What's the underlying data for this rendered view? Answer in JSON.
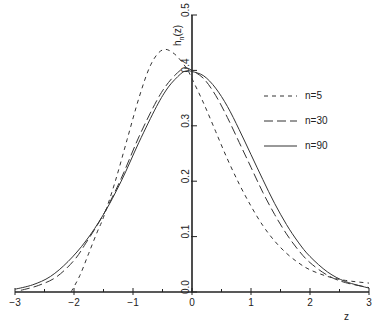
{
  "chart_data": {
    "type": "line",
    "title": "",
    "xlabel": "z",
    "ylabel": "h_n(z)",
    "xlim": [
      -3,
      3
    ],
    "ylim": [
      0.0,
      0.5
    ],
    "grid": false,
    "legend_position": "right, inside",
    "x_ticks": [
      "-3",
      "-2",
      "-1",
      "0",
      "1",
      "2",
      "3"
    ],
    "y_ticks": [
      "0.0",
      "0.1",
      "0.2",
      "0.3",
      "0.4",
      "0.5"
    ],
    "series": [
      {
        "name": "n=5",
        "style": "short-dash",
        "x": [
          -2.05,
          -1.9,
          -1.75,
          -1.6,
          -1.5,
          -1.3,
          -1.1,
          -0.9,
          -0.7,
          -0.5,
          -0.3,
          -0.1,
          0.0,
          0.2,
          0.4,
          0.6,
          0.8,
          1.0,
          1.2,
          1.4,
          1.6,
          1.8,
          2.0,
          2.3,
          2.6,
          3.0
        ],
        "y": [
          0.0,
          0.03,
          0.07,
          0.11,
          0.135,
          0.2,
          0.275,
          0.35,
          0.41,
          0.437,
          0.43,
          0.405,
          0.385,
          0.34,
          0.29,
          0.24,
          0.195,
          0.155,
          0.12,
          0.092,
          0.07,
          0.053,
          0.04,
          0.028,
          0.021,
          0.016
        ]
      },
      {
        "name": "n=30",
        "style": "long-dash",
        "x": [
          -2.9,
          -2.6,
          -2.3,
          -2.0,
          -1.8,
          -1.5,
          -1.2,
          -0.9,
          -0.6,
          -0.4,
          -0.2,
          -0.1,
          0.0,
          0.2,
          0.4,
          0.6,
          0.8,
          1.0,
          1.2,
          1.4,
          1.6,
          1.8,
          2.0,
          2.3,
          2.6,
          3.0
        ],
        "y": [
          0.003,
          0.012,
          0.027,
          0.057,
          0.088,
          0.14,
          0.205,
          0.28,
          0.345,
          0.378,
          0.4,
          0.404,
          0.4,
          0.385,
          0.355,
          0.315,
          0.27,
          0.225,
          0.18,
          0.14,
          0.105,
          0.076,
          0.053,
          0.03,
          0.017,
          0.008
        ]
      },
      {
        "name": "n=90",
        "style": "solid",
        "x": [
          -3.0,
          -2.7,
          -2.4,
          -2.1,
          -1.8,
          -1.5,
          -1.2,
          -0.9,
          -0.6,
          -0.4,
          -0.2,
          -0.1,
          0.0,
          0.2,
          0.4,
          0.6,
          0.8,
          1.0,
          1.2,
          1.4,
          1.6,
          1.8,
          2.0,
          2.3,
          2.6,
          3.0
        ],
        "y": [
          0.005,
          0.013,
          0.028,
          0.055,
          0.092,
          0.14,
          0.2,
          0.27,
          0.335,
          0.37,
          0.393,
          0.399,
          0.398,
          0.39,
          0.368,
          0.335,
          0.293,
          0.248,
          0.203,
          0.16,
          0.122,
          0.09,
          0.064,
          0.036,
          0.019,
          0.007
        ]
      }
    ]
  },
  "axes": {
    "x_label": "z",
    "y_label_main": "h",
    "y_label_sub": "n",
    "y_label_arg": "(z)"
  },
  "legend": {
    "items": [
      {
        "label": "n=5"
      },
      {
        "label": "n=30"
      },
      {
        "label": "n=90"
      }
    ]
  }
}
